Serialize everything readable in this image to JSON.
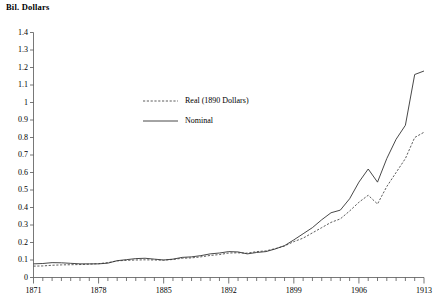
{
  "chart_data": {
    "type": "line",
    "title": "",
    "ylabel": "Bil. Dollars",
    "xlabel": "",
    "ylim": [
      0,
      1.4
    ],
    "xlim": [
      1871,
      1913
    ],
    "ytick_step": 0.1,
    "grid": false,
    "legend_position": "center-left",
    "ytick_labels": [
      "1.4",
      "1.3",
      "1.2",
      "1.1",
      "1",
      "0.9",
      "0.8",
      "0.7",
      "0.6",
      "0.5",
      "0.4",
      "0.3",
      "0.2",
      "0.1",
      "0"
    ],
    "ytick_values": [
      1.4,
      1.3,
      1.2,
      1.1,
      1.0,
      0.9,
      0.8,
      0.7,
      0.6,
      0.5,
      0.4,
      0.3,
      0.2,
      0.1,
      0.0
    ],
    "xtick_labels": [
      "1871",
      "1878",
      "1885",
      "1892",
      "1899",
      "1906",
      "1913"
    ],
    "xtick_values": [
      1871,
      1878,
      1885,
      1892,
      1899,
      1906,
      1913
    ],
    "x": [
      1871,
      1872,
      1873,
      1874,
      1875,
      1876,
      1877,
      1878,
      1879,
      1880,
      1881,
      1882,
      1883,
      1884,
      1885,
      1886,
      1887,
      1888,
      1889,
      1890,
      1891,
      1892,
      1893,
      1894,
      1895,
      1896,
      1897,
      1898,
      1899,
      1900,
      1901,
      1902,
      1903,
      1904,
      1905,
      1906,
      1907,
      1908,
      1909,
      1910,
      1911,
      1912,
      1913
    ],
    "series": [
      {
        "name": "Real (1890 Dollars)",
        "style": "dashed",
        "color": "#4a4a4a",
        "values": [
          0.065,
          0.066,
          0.07,
          0.072,
          0.073,
          0.074,
          0.076,
          0.079,
          0.085,
          0.095,
          0.098,
          0.1,
          0.101,
          0.1,
          0.099,
          0.103,
          0.11,
          0.112,
          0.118,
          0.126,
          0.131,
          0.14,
          0.141,
          0.139,
          0.148,
          0.152,
          0.165,
          0.18,
          0.205,
          0.225,
          0.255,
          0.285,
          0.315,
          0.335,
          0.38,
          0.43,
          0.47,
          0.42,
          0.52,
          0.6,
          0.68,
          0.8,
          0.83
        ]
      },
      {
        "name": "Nominal",
        "style": "solid",
        "color": "#333333",
        "values": [
          0.078,
          0.08,
          0.085,
          0.084,
          0.081,
          0.078,
          0.078,
          0.078,
          0.082,
          0.096,
          0.102,
          0.108,
          0.11,
          0.105,
          0.1,
          0.105,
          0.115,
          0.118,
          0.125,
          0.135,
          0.14,
          0.148,
          0.146,
          0.135,
          0.143,
          0.148,
          0.163,
          0.182,
          0.215,
          0.25,
          0.285,
          0.33,
          0.37,
          0.385,
          0.45,
          0.545,
          0.62,
          0.545,
          0.68,
          0.79,
          0.87,
          1.16,
          1.18
        ]
      }
    ]
  },
  "legend": {
    "entries": [
      {
        "label": "Real (1890 Dollars)"
      },
      {
        "label": "Nominal"
      }
    ]
  }
}
